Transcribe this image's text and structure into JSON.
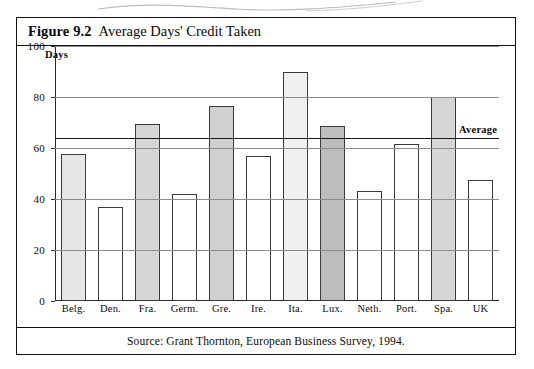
{
  "figure": {
    "number": "Figure 9.2",
    "title": "Average Days' Credit Taken",
    "source": "Source: Grant Thornton, European Business Survey, 1994."
  },
  "chart_data": {
    "type": "bar",
    "title": "Average Days' Credit Taken",
    "xlabel": "",
    "ylabel": "Days",
    "ylim": [
      0,
      100
    ],
    "yticks": [
      0,
      20,
      40,
      60,
      80,
      100
    ],
    "grid": true,
    "legend": "none",
    "categories": [
      "Belg.",
      "Den.",
      "Fra.",
      "Germ.",
      "Gre.",
      "Ire.",
      "Ita.",
      "Lux.",
      "Neth.",
      "Port.",
      "Spa.",
      "UK"
    ],
    "values": [
      57.5,
      37,
      69.5,
      42,
      76.5,
      57,
      90,
      68.5,
      43,
      61.5,
      80,
      47.5
    ],
    "bar_fills": [
      "#e6e6e6",
      "#ffffff",
      "#d6d6d6",
      "#ffffff",
      "#d0d0d0",
      "#ffffff",
      "#f0f0f0",
      "#bdbdbd",
      "#ffffff",
      "#ffffff",
      "#d6d6d6",
      "#ffffff"
    ],
    "annotations": [
      {
        "name": "average-line",
        "label": "Average",
        "value": 64
      }
    ]
  },
  "colors": {
    "frame": "#111111",
    "axis": "#2a2a2a",
    "gridline": "#8c8c8c",
    "average_line": "#1a1a1a",
    "page_background": "#ffffff"
  }
}
